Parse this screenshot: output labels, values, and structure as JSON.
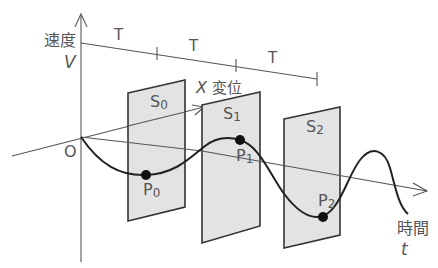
{
  "axes": {
    "velocity": {
      "label": "速度",
      "symbol": "V"
    },
    "displacement": {
      "label": "変位",
      "symbol": "X"
    },
    "time": {
      "label": "時間",
      "symbol": "t"
    },
    "origin": "O"
  },
  "period_labels": [
    "T",
    "T",
    "T"
  ],
  "planes": [
    {
      "id": "S0",
      "main": "S",
      "sub": "0"
    },
    {
      "id": "S1",
      "main": "S",
      "sub": "1"
    },
    {
      "id": "S2",
      "main": "S",
      "sub": "2"
    }
  ],
  "points": [
    {
      "id": "P0",
      "main": "P",
      "sub": "0"
    },
    {
      "id": "P1",
      "main": "P",
      "sub": "1"
    },
    {
      "id": "P2",
      "main": "P",
      "sub": "2"
    }
  ],
  "colors": {
    "plane_fill": "#e2e2e2",
    "plane_stroke": "#333333",
    "axis": "#555555",
    "curve": "#222222",
    "text": "#555555"
  }
}
